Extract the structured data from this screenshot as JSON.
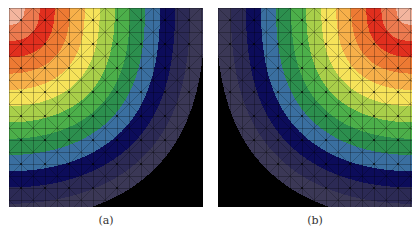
{
  "figure": {
    "panels": [
      {
        "id": "a",
        "caption": "(a)",
        "origin_corner": "top-left"
      },
      {
        "id": "b",
        "caption": "(b)",
        "origin_corner": "top-right"
      }
    ],
    "colormap": {
      "band_colors": [
        "#f3b59e",
        "#ec7a4f",
        "#e12f1e",
        "#ee7a33",
        "#f7b04a",
        "#f6e35a",
        "#a9cf4a",
        "#4caf4a",
        "#2c8f4e",
        "#3a6fa0",
        "#0c0c5a",
        "#2c2a55",
        "#3b3856",
        "#000000"
      ],
      "description": "contour bands from peak (corner) to zero (opposite edges)"
    },
    "mesh": {
      "cell_px": 12,
      "line_color": "#000000",
      "diagonals": true
    },
    "field": {
      "function": "superellipse distance from corner",
      "exponent": 3.2,
      "x_scale": 1.0,
      "y_scale": 0.93
    }
  }
}
